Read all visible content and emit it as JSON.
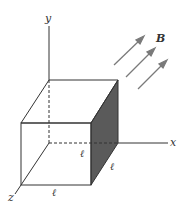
{
  "diagram": {
    "type": "3d-cube-in-magnetic-field",
    "axes": {
      "x_label": "x",
      "y_label": "y",
      "z_label": "z"
    },
    "field": {
      "label": "B",
      "arrow_count": 3
    },
    "cube": {
      "edge_labels": [
        "ℓ",
        "ℓ",
        "ℓ"
      ],
      "shaded_face": "right (+x) face"
    },
    "colors": {
      "lines": "#333333",
      "shaded_face": "#5a5a5a",
      "arrows": "#7a7a7a",
      "background": "#ffffff"
    }
  }
}
